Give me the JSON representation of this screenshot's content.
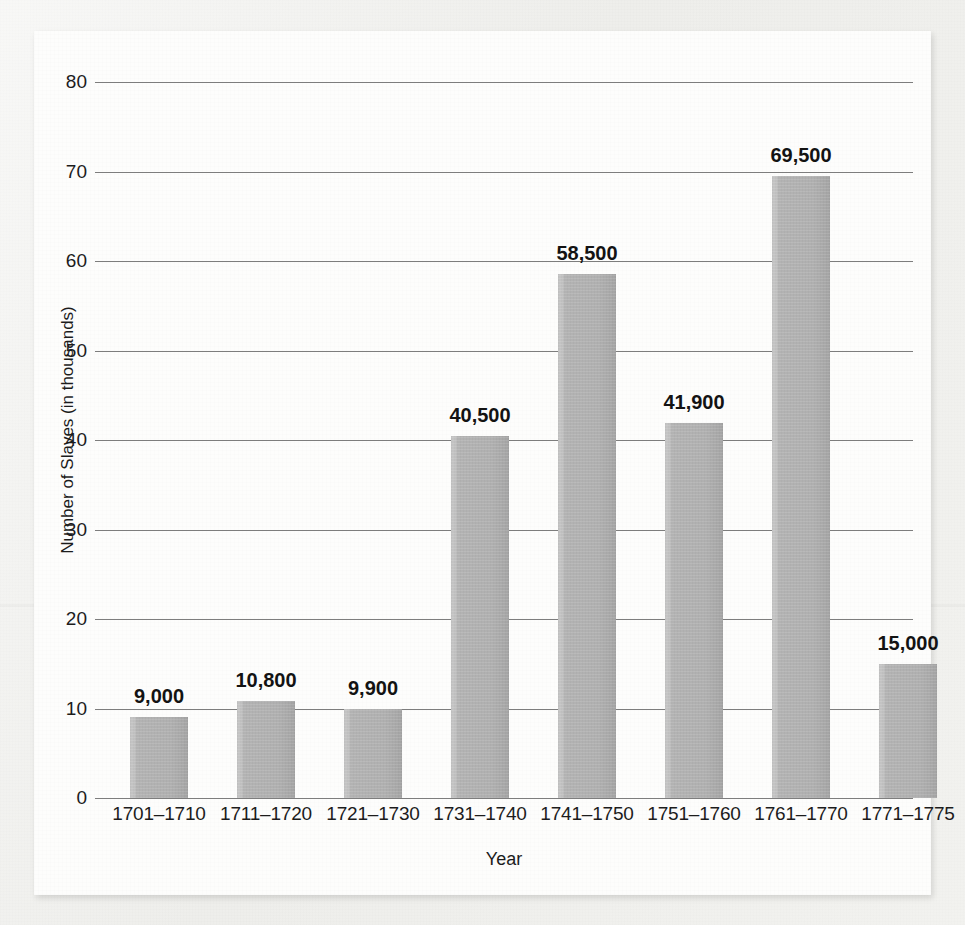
{
  "chart_data": {
    "type": "bar",
    "title": "",
    "xlabel": "Year",
    "ylabel": "Number of Slaves (in thousands)",
    "categories": [
      "1701–1710",
      "1711–1720",
      "1721–1730",
      "1731–1740",
      "1741–1750",
      "1751–1760",
      "1761–1770",
      "1771–1775"
    ],
    "values": [
      9000,
      10800,
      9900,
      40500,
      58500,
      41900,
      69500,
      15000
    ],
    "value_labels": [
      "9,000",
      "10,800",
      "9,900",
      "40,500",
      "58,500",
      "41,900",
      "69,500",
      "15,000"
    ],
    "values_in_thousands": [
      9.0,
      10.8,
      9.9,
      40.5,
      58.5,
      41.9,
      69.5,
      15.0
    ],
    "ylim": [
      0,
      80
    ],
    "ytick_values": [
      0,
      10,
      20,
      30,
      40,
      50,
      60,
      70,
      80
    ],
    "ytick_labels": [
      "0",
      "10",
      "20",
      "30",
      "40",
      "50",
      "60",
      "70",
      "80"
    ],
    "grid": true,
    "legend": "none",
    "bar_color": "#b0b0b0",
    "gridline_color": "#7d7d7d",
    "panel_color": "#fdfdfc",
    "page_color": "#efefec",
    "text_color": "#1c1c1c"
  }
}
